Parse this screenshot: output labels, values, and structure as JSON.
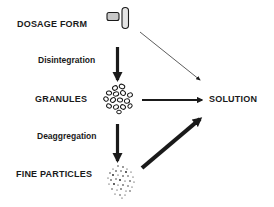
{
  "diagram": {
    "nodes": {
      "dosage_form": {
        "label": "DOSAGE FORM",
        "icon": "tablet-and-capsule-icon"
      },
      "granules": {
        "label": "GRANULES",
        "icon": "granule-cluster-icon"
      },
      "fine_particles": {
        "label": "FINE PARTICLES",
        "icon": "fine-particles-icon"
      },
      "solution": {
        "label": "SOLUTION"
      }
    },
    "edges": [
      {
        "from": "DOSAGE FORM",
        "to": "GRANULES",
        "label": "Disintegration",
        "weight": "medium"
      },
      {
        "from": "GRANULES",
        "to": "FINE PARTICLES",
        "label": "Deaggregation",
        "weight": "medium"
      },
      {
        "from": "DOSAGE FORM",
        "to": "SOLUTION",
        "label": "",
        "weight": "thin"
      },
      {
        "from": "GRANULES",
        "to": "SOLUTION",
        "label": "",
        "weight": "medium"
      },
      {
        "from": "FINE PARTICLES",
        "to": "SOLUTION",
        "label": "",
        "weight": "thick"
      }
    ],
    "colors": {
      "ink": "#1a1a1a",
      "tablet_fill": "#c8c8c8",
      "background": "#ffffff"
    }
  }
}
